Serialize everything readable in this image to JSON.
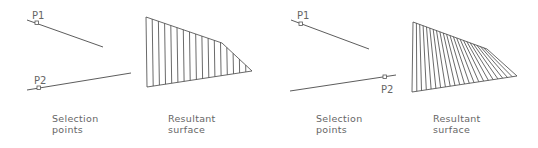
{
  "panels": [
    {
      "id": "selection-1",
      "caption_line1": "Selection",
      "caption_line2": "points",
      "p1_label": "P1",
      "p2_label": "P2"
    },
    {
      "id": "surface-1",
      "caption_line1": "Resultant",
      "caption_line2": "surface"
    },
    {
      "id": "selection-2",
      "caption_line1": "Selection",
      "caption_line2": "points",
      "p1_label": "P1",
      "p2_label": "P2"
    },
    {
      "id": "surface-2",
      "caption_line1": "Resultant",
      "caption_line2": "surface"
    }
  ],
  "colors": {
    "line": "#4a4a4a",
    "text": "#666666",
    "background": "#ffffff"
  }
}
